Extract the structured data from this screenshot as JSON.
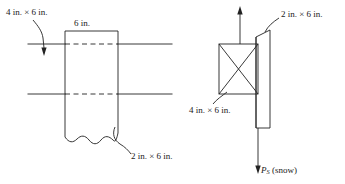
{
  "figure": {
    "stroke_color": "#222222",
    "background_color": "#ffffff",
    "left_view": {
      "name": "elevation view",
      "labels": {
        "member_4x6": "4 in. × 6 in.",
        "width_dimension": "6 in.",
        "member_2x6": "2 in. × 6 in."
      }
    },
    "right_view": {
      "name": "section view with loads",
      "labels": {
        "member_2x6": "2 in. × 6 in.",
        "member_4x6": "4 in. × 6 in.",
        "load_symbol": "P",
        "load_subscript": "S",
        "load_description": "(snow)"
      }
    }
  }
}
